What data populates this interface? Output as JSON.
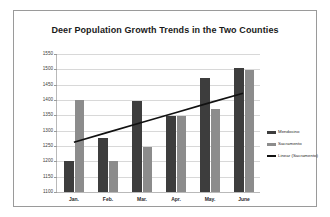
{
  "chart_data": {
    "type": "bar",
    "title": "Deer Population Growth Trends in the Two Counties",
    "xlabel": "",
    "ylabel": "",
    "categories": [
      "Jan.",
      "Feb.",
      "Mar.",
      "Apr.",
      "May.",
      "June"
    ],
    "series": [
      {
        "name": "Mendocino",
        "color": "#3d3d3d",
        "values": [
          1200,
          1275,
          1398,
          1348,
          1472,
          1505
        ]
      },
      {
        "name": "Sacramento",
        "color": "#8c8c8c",
        "values": [
          1400,
          1200,
          1248,
          1348,
          1370,
          1498
        ]
      },
      {
        "name": "Linear (Sacramento)",
        "color": "#111111",
        "type": "line",
        "trendline": true,
        "values": [
          1263,
          1295,
          1327,
          1359,
          1391,
          1422
        ]
      }
    ],
    "ylim": [
      1100,
      1550
    ],
    "yticks": [
      1100,
      1150,
      1200,
      1250,
      1300,
      1350,
      1400,
      1450,
      1500,
      1550
    ],
    "ytick_labels": [
      "1100",
      "1150",
      "1200",
      "1250",
      "1300",
      "1350",
      "1400",
      "1450",
      "1500",
      "1550"
    ],
    "grid": true,
    "legend_position": "right",
    "legend_entries": [
      "Mendocino",
      "Sacramento",
      "Linear (Sacramento)"
    ]
  }
}
